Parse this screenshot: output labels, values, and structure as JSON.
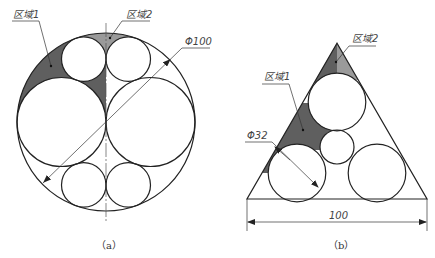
{
  "figures": [
    {
      "id": "a",
      "caption": "（a）",
      "labels": {
        "region1": "区域1",
        "region2": "区域2",
        "diameter": "Φ100"
      },
      "colors": {
        "region1_fill": "#5f5f5f",
        "region2_fill": "#9a9a9a"
      }
    },
    {
      "id": "b",
      "caption": "（b）",
      "labels": {
        "region1": "区域1",
        "region2": "区域2",
        "diameter": "Φ32",
        "width": "100"
      },
      "colors": {
        "region1_fill": "#5f5f5f",
        "region2_fill": "#9a9a9a"
      }
    }
  ]
}
